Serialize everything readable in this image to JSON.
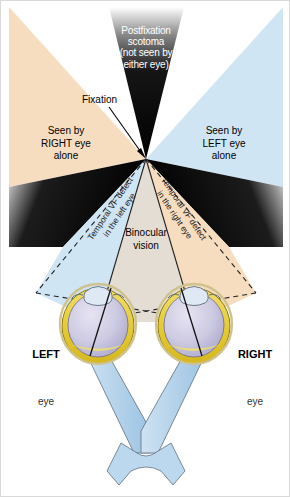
{
  "figure": {
    "background": "#ffffff"
  },
  "colors": {
    "right_eye_field": "#f7ddc0",
    "left_eye_field": "#cfe5f3",
    "binocular_field": "#e3ddd3",
    "scotoma": "#000000",
    "optic_nerve": "#b8d4ec",
    "sclera": "#e9cf45",
    "vitreous": "#c3c0de",
    "cornea": "#dfe8f5",
    "outline": "#3a3a3a",
    "text": "#000000",
    "scotoma_text": "#ffffff"
  },
  "labels": {
    "scotoma": "Postfixation\nscotoma\n(not seen by\neither eye)",
    "fixation": "Fixation",
    "seen_by_right_alone": "Seen by\nRIGHT eye\nalone",
    "seen_by_left_alone": "Seen by\nLEFT eye\nalone",
    "binocular": "Binocular\nvision",
    "temporal_defect_left": "Temporal VF defect\nin the left eye",
    "temporal_defect_right": "Temporal VF defect\nin the right eye",
    "left_eye_name": "LEFT",
    "left_eye_sub": "eye",
    "right_eye_name": "RIGHT",
    "right_eye_sub": "eye"
  },
  "geometry": {
    "fixation_point": [
      145,
      158
    ],
    "left_eye_center": [
      97,
      321
    ],
    "right_eye_center": [
      193,
      321
    ],
    "chiasm_center": [
      145,
      455
    ]
  }
}
